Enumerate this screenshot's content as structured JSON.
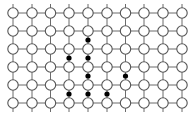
{
  "figure": {
    "width": 196,
    "height": 118,
    "background_color": "#ffffff"
  },
  "lattice": {
    "type": "square-grid",
    "columns": 10,
    "rows": 6,
    "column_x": [
      13,
      32,
      50.5,
      69,
      88,
      107,
      125.5,
      144,
      163,
      182
    ],
    "row_y": [
      13,
      31,
      49,
      67,
      85,
      103
    ],
    "node": {
      "shape": "circle",
      "radius": 5.2,
      "fill_color": "#ffffff",
      "stroke_color": "#555555",
      "stroke_width": 1.1
    },
    "bond": {
      "stroke_color": "#6b6b6b",
      "stroke_width": 1.0
    }
  },
  "dots": {
    "label": "filled interstitial sites",
    "count": 8,
    "fill_color": "#000000",
    "radius": 2.6,
    "points": [
      {
        "x": 88,
        "y": 40
      },
      {
        "x": 69,
        "y": 58
      },
      {
        "x": 88,
        "y": 58
      },
      {
        "x": 88,
        "y": 76
      },
      {
        "x": 125.5,
        "y": 76
      },
      {
        "x": 69,
        "y": 94
      },
      {
        "x": 88,
        "y": 94
      },
      {
        "x": 107,
        "y": 94
      }
    ]
  },
  "chart_data": {
    "type": "scatter",
    "xlabel": "",
    "ylabel": "",
    "xlim": [
      0,
      196
    ],
    "ylim": [
      0,
      118
    ],
    "grid": true,
    "series": [
      {
        "name": "lattice-nodes",
        "marker": "open-circle",
        "color": "#555555",
        "x": [
          13,
          32,
          50.5,
          69,
          88,
          107,
          125.5,
          144,
          163,
          182,
          13,
          32,
          50.5,
          69,
          88,
          107,
          125.5,
          144,
          163,
          182,
          13,
          32,
          50.5,
          69,
          88,
          107,
          125.5,
          144,
          163,
          182,
          13,
          32,
          50.5,
          69,
          88,
          107,
          125.5,
          144,
          163,
          182,
          13,
          32,
          50.5,
          69,
          88,
          107,
          125.5,
          144,
          163,
          182,
          13,
          32,
          50.5,
          69,
          88,
          107,
          125.5,
          144,
          163,
          182
        ],
        "y": [
          13,
          13,
          13,
          13,
          13,
          13,
          13,
          13,
          13,
          13,
          31,
          31,
          31,
          31,
          31,
          31,
          31,
          31,
          31,
          31,
          49,
          49,
          49,
          49,
          49,
          49,
          49,
          49,
          49,
          49,
          67,
          67,
          67,
          67,
          67,
          67,
          67,
          67,
          67,
          67,
          85,
          85,
          85,
          85,
          85,
          85,
          85,
          85,
          85,
          85,
          103,
          103,
          103,
          103,
          103,
          103,
          103,
          103,
          103,
          103
        ]
      },
      {
        "name": "interstitial-dots",
        "marker": "filled-circle",
        "color": "#000000",
        "x": [
          88,
          69,
          88,
          88,
          125.5,
          69,
          88,
          107
        ],
        "y": [
          40,
          58,
          58,
          76,
          76,
          94,
          94,
          94
        ]
      }
    ]
  }
}
